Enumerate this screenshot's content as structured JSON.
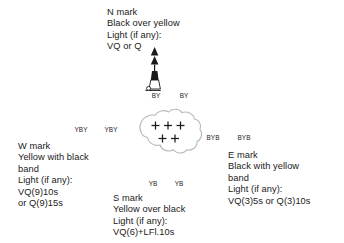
{
  "diagram": {
    "background_color": "#ffffff",
    "ink_color": "#1a1a1a",
    "danger_outline_color": "#b9b9b9",
    "danger_symbol": "+",
    "danger_symbol_count": 5,
    "danger_symbol_rows": [
      3,
      2
    ]
  },
  "marks": {
    "north": {
      "heading": "N mark",
      "colour_description": "Black over yellow",
      "light_label": "Light (if any):",
      "light_character": "VQ or Q",
      "buoy_code": "BY",
      "buoys": [
        {
          "form": "pillar",
          "code": "BY"
        },
        {
          "form": "spar",
          "code": "BY"
        }
      ]
    },
    "west": {
      "heading": "W mark",
      "colour_description_line1": "Yellow with black",
      "colour_description_line2": "band",
      "light_label": "Light (if any):",
      "light_character_line1": "VQ(9)10s",
      "light_character_line2": "or Q(9)15s",
      "buoy_code": "YBY",
      "buoys": [
        {
          "form": "pillar",
          "code": "YBY"
        },
        {
          "form": "spar",
          "code": "YBY"
        }
      ]
    },
    "east": {
      "heading": "E mark",
      "colour_description_line1": "Black with yellow",
      "colour_description_line2": "band",
      "light_label": "Light (if any):",
      "light_character": "VQ(3)5s or Q(3)10s",
      "buoy_code": "BYB",
      "buoys": [
        {
          "form": "pillar",
          "code": "BYB"
        },
        {
          "form": "spar",
          "code": "BYB"
        }
      ]
    },
    "south": {
      "heading": "S mark",
      "colour_description": "Yellow over black",
      "light_label": "Light (if any):",
      "light_character": "VQ(6)+LFl.10s",
      "buoy_code": "YB",
      "buoys": [
        {
          "form": "pillar",
          "code": "YB"
        },
        {
          "form": "spar",
          "code": "YB"
        }
      ]
    }
  }
}
